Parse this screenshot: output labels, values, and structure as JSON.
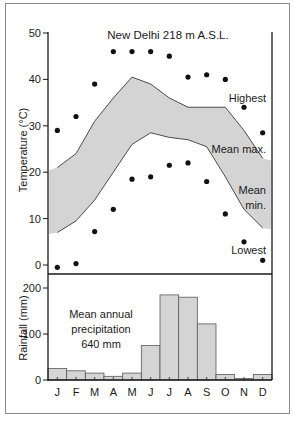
{
  "chart_data": [
    {
      "type": "line",
      "title": "New Delhi 218 m A.S.L.",
      "xlabel": "",
      "ylabel": "Temperature (°C)",
      "ylim": [
        -2,
        50
      ],
      "yticks": [
        0,
        10,
        20,
        30,
        40,
        50
      ],
      "categories": [
        "J",
        "F",
        "M",
        "A",
        "M",
        "J",
        "J",
        "A",
        "S",
        "O",
        "N",
        "D"
      ],
      "grid": false,
      "series": [
        {
          "name": "Highest",
          "style": "points",
          "values": [
            29,
            32,
            39,
            46,
            46,
            46,
            45,
            40.5,
            41,
            40,
            34,
            28.5
          ]
        },
        {
          "name": "Mean max.",
          "style": "line",
          "values": [
            21,
            24,
            31,
            36,
            40.5,
            39,
            36,
            34,
            34,
            34,
            29,
            23
          ]
        },
        {
          "name": "Mean min.",
          "style": "line",
          "values": [
            7,
            9.5,
            14,
            20,
            26,
            28.5,
            27.5,
            27,
            25.5,
            19,
            12,
            8
          ]
        },
        {
          "name": "Lowest",
          "style": "points",
          "values": [
            -0.5,
            0.3,
            7.2,
            12,
            18.5,
            19,
            21.5,
            22,
            18,
            11,
            5,
            1
          ]
        }
      ],
      "annotations": [
        "Highest",
        "Mean max.",
        "Mean min.",
        "Lowest"
      ],
      "shaded_band": "between Mean max. and Mean min."
    },
    {
      "type": "bar",
      "title": "",
      "xlabel": "",
      "ylabel": "Rainfall (mm)",
      "ylim": [
        0,
        200
      ],
      "yticks": [
        0,
        100,
        200
      ],
      "categories": [
        "J",
        "F",
        "M",
        "A",
        "M",
        "J",
        "J",
        "A",
        "S",
        "O",
        "N",
        "D"
      ],
      "values": [
        25,
        20,
        15,
        8,
        15,
        75,
        185,
        180,
        122,
        12,
        3,
        12
      ],
      "annotations": [
        "Mean annual",
        "precipitation",
        "640 mm"
      ]
    }
  ],
  "labels": {
    "title": "New Delhi 218 m A.S.L.",
    "temp_axis": "Temperature (°C)",
    "rain_axis": "Rainfall (mm)",
    "highest": "Highest",
    "mean_max": "Mean max.",
    "mean_min_1": "Mean",
    "mean_min_2": "min.",
    "lowest": "Lowest",
    "precip_1": "Mean annual",
    "precip_2": "precipitation",
    "precip_3": "640 mm",
    "temp_ticks": [
      "50",
      "40",
      "30",
      "20",
      "10",
      "0"
    ],
    "rain_ticks": [
      "200",
      "100",
      "0"
    ],
    "months": [
      "J",
      "F",
      "M",
      "A",
      "M",
      "J",
      "J",
      "A",
      "S",
      "O",
      "N",
      "D"
    ]
  },
  "colors": {
    "band_fill": "#d4d4d4",
    "bar_fill": "#d4d4d4",
    "line": "#2a2a2a",
    "point": "#111111",
    "frame": "#8a8a8a"
  }
}
